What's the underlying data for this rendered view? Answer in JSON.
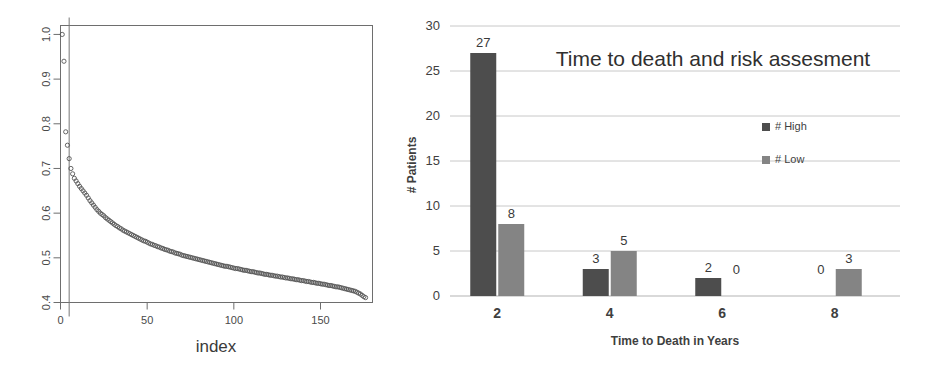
{
  "chart_data": [
    {
      "id": "index-plot",
      "type": "scatter",
      "title": "",
      "xlabel": "index",
      "ylabel": "",
      "xlim": [
        0,
        180
      ],
      "ylim": [
        0.4,
        1.02
      ],
      "xticks": [
        0,
        50,
        100,
        150
      ],
      "xtick_labels": [
        "0",
        "50",
        "100",
        "150"
      ],
      "yticks": [
        0.4,
        0.5,
        0.6,
        0.7,
        0.8,
        0.9,
        1.0
      ],
      "ytick_labels": [
        "0.4",
        "0.5",
        "0.6",
        "0.7",
        "0.8",
        "0.9",
        "1.0"
      ],
      "grid": false,
      "marker": "open-circle",
      "marker_color": "#555555",
      "vline_x": 5,
      "x": [
        1,
        2,
        3,
        4,
        5,
        6,
        7,
        8,
        9,
        10,
        11,
        12,
        13,
        14,
        15,
        16,
        17,
        18,
        19,
        20,
        21,
        22,
        23,
        24,
        25,
        26,
        27,
        28,
        29,
        30,
        31,
        32,
        33,
        34,
        35,
        36,
        37,
        38,
        39,
        40,
        41,
        42,
        43,
        44,
        45,
        46,
        47,
        48,
        49,
        50,
        51,
        52,
        53,
        54,
        55,
        56,
        57,
        58,
        59,
        60,
        61,
        62,
        63,
        64,
        65,
        66,
        67,
        68,
        69,
        70,
        71,
        72,
        73,
        74,
        75,
        76,
        77,
        78,
        79,
        80,
        81,
        82,
        83,
        84,
        85,
        86,
        87,
        88,
        89,
        90,
        91,
        92,
        93,
        94,
        95,
        96,
        97,
        98,
        99,
        100,
        101,
        102,
        103,
        104,
        105,
        106,
        107,
        108,
        109,
        110,
        111,
        112,
        113,
        114,
        115,
        116,
        117,
        118,
        119,
        120,
        121,
        122,
        123,
        124,
        125,
        126,
        127,
        128,
        129,
        130,
        131,
        132,
        133,
        134,
        135,
        136,
        137,
        138,
        139,
        140,
        141,
        142,
        143,
        144,
        145,
        146,
        147,
        148,
        149,
        150,
        151,
        152,
        153,
        154,
        155,
        156,
        157,
        158,
        159,
        160,
        161,
        162,
        163,
        164,
        165,
        166,
        167,
        168,
        169,
        170,
        171,
        172,
        173,
        174,
        175,
        176
      ],
      "y": [
        1.0,
        0.94,
        0.782,
        0.752,
        0.722,
        0.7,
        0.688,
        0.678,
        0.672,
        0.666,
        0.66,
        0.655,
        0.65,
        0.645,
        0.64,
        0.634,
        0.628,
        0.623,
        0.618,
        0.613,
        0.608,
        0.604,
        0.6,
        0.597,
        0.594,
        0.59,
        0.587,
        0.584,
        0.581,
        0.578,
        0.575,
        0.572,
        0.57,
        0.567,
        0.565,
        0.562,
        0.56,
        0.558,
        0.556,
        0.554,
        0.552,
        0.55,
        0.548,
        0.546,
        0.544,
        0.542,
        0.54,
        0.538,
        0.537,
        0.535,
        0.533,
        0.531,
        0.53,
        0.528,
        0.527,
        0.525,
        0.524,
        0.522,
        0.521,
        0.519,
        0.518,
        0.517,
        0.515,
        0.514,
        0.513,
        0.511,
        0.51,
        0.509,
        0.508,
        0.506,
        0.505,
        0.504,
        0.503,
        0.502,
        0.501,
        0.5,
        0.499,
        0.498,
        0.497,
        0.496,
        0.495,
        0.494,
        0.493,
        0.492,
        0.491,
        0.49,
        0.489,
        0.488,
        0.487,
        0.486,
        0.485,
        0.484,
        0.483,
        0.482,
        0.481,
        0.481,
        0.48,
        0.479,
        0.478,
        0.477,
        0.476,
        0.476,
        0.475,
        0.474,
        0.473,
        0.472,
        0.472,
        0.471,
        0.47,
        0.469,
        0.469,
        0.468,
        0.467,
        0.466,
        0.466,
        0.465,
        0.464,
        0.463,
        0.463,
        0.462,
        0.461,
        0.461,
        0.46,
        0.459,
        0.459,
        0.458,
        0.457,
        0.457,
        0.456,
        0.455,
        0.455,
        0.454,
        0.453,
        0.453,
        0.452,
        0.451,
        0.451,
        0.45,
        0.449,
        0.449,
        0.448,
        0.447,
        0.447,
        0.446,
        0.445,
        0.445,
        0.444,
        0.443,
        0.443,
        0.442,
        0.441,
        0.441,
        0.44,
        0.439,
        0.438,
        0.438,
        0.437,
        0.436,
        0.435,
        0.435,
        0.434,
        0.433,
        0.432,
        0.431,
        0.43,
        0.429,
        0.428,
        0.427,
        0.426,
        0.425,
        0.423,
        0.421,
        0.419,
        0.416,
        0.413,
        0.411
      ]
    },
    {
      "id": "time-to-death-bars",
      "type": "bar",
      "title": "Time to death and risk assesment",
      "xlabel": "Time to Death in Years",
      "ylabel": "# Patients",
      "categories": [
        "2",
        "4",
        "6",
        "8"
      ],
      "ylim": [
        0,
        30
      ],
      "yticks": [
        0,
        5,
        10,
        15,
        20,
        25,
        30
      ],
      "ytick_labels": [
        "0",
        "5",
        "10",
        "15",
        "20",
        "25",
        "30"
      ],
      "grid": true,
      "legend_position": "inside-right",
      "series": [
        {
          "name": "# High",
          "color": "#4d4d4d",
          "values": [
            27,
            3,
            2,
            0
          ]
        },
        {
          "name": "# Low",
          "color": "#848484",
          "values": [
            8,
            5,
            0,
            3
          ]
        }
      ]
    }
  ],
  "colors": {
    "high": "#4d4d4d",
    "low": "#848484",
    "grid": "#c8c8c8",
    "axis": "#6e6e6e",
    "text": "#3b3b3b",
    "background": "#ffffff"
  }
}
